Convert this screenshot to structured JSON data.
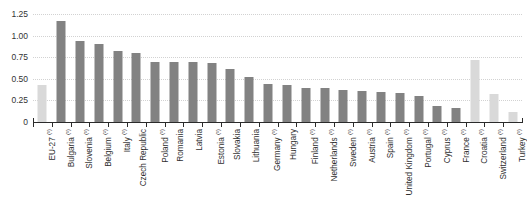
{
  "chart_data": {
    "type": "bar",
    "title": "",
    "subtitle": "",
    "xlabel": "",
    "ylabel": "",
    "ylim": [
      0,
      1.3
    ],
    "grid": true,
    "legend": "none",
    "orientation": "vertical",
    "label_rotation": -90,
    "ytick_labels": [
      "1.25",
      "1.00",
      "0.75",
      "0.50",
      "0.25",
      "0"
    ],
    "ytick_values": [
      1.25,
      1.0,
      0.75,
      0.5,
      0.25,
      0
    ],
    "colors": {
      "dark_bar": "#828282",
      "light_bar": "#d9d9d9",
      "gridline": "#d2d2d2",
      "axis": "#2b2b2b",
      "text": "#2f2f2f",
      "background": "#ffffff"
    },
    "categories": [
      "EU-27",
      "Bulgaria",
      "Slovenia",
      "Belgium",
      "Italy",
      "Czech Republic",
      "Poland",
      "Romania",
      "Latvia",
      "Estonia",
      "Slovakia",
      "Lithuania",
      "Germany",
      "Hungary",
      "Finland",
      "Netherlands",
      "Sweden",
      "Austria",
      "Spain",
      "United Kingdom",
      "Portugal",
      "Cyprus",
      "France",
      "Croatia",
      "Switzerland",
      "Turkey"
    ],
    "values": [
      0.43,
      1.17,
      0.94,
      0.9,
      0.83,
      0.8,
      0.7,
      0.7,
      0.7,
      0.68,
      0.62,
      0.52,
      0.44,
      0.43,
      0.4,
      0.39,
      0.37,
      0.36,
      0.35,
      0.34,
      0.3,
      0.19,
      0.16,
      0.72,
      0.33,
      0.12
    ],
    "footnotes": [
      "(¹)",
      "(¹)",
      "(¹)",
      "(²)",
      "(¹)",
      "",
      "(¹)",
      "",
      "",
      "(¹)",
      "",
      "",
      "(¹)",
      "",
      "(¹)",
      "(¹)",
      "(¹)",
      "(¹)",
      "(¹)",
      "(¹)",
      "(¹)",
      "(¹)",
      "(¹)",
      "(¹)",
      "(¹)",
      "(¹)"
    ],
    "bar_styles": [
      "light",
      "dark",
      "dark",
      "dark",
      "dark",
      "dark",
      "dark",
      "dark",
      "dark",
      "dark",
      "dark",
      "dark",
      "dark",
      "dark",
      "dark",
      "dark",
      "dark",
      "dark",
      "dark",
      "dark",
      "dark",
      "dark",
      "dark",
      "light",
      "light",
      "light"
    ]
  }
}
